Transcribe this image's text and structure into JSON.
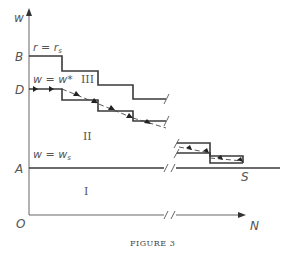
{
  "figure": {
    "caption": "FIGURE 3",
    "axes": {
      "y_label": "w",
      "x_label": "N",
      "origin_label": "O"
    },
    "y_ticks": [
      {
        "label": "B",
        "y": 56
      },
      {
        "label": "D",
        "y": 89
      },
      {
        "label": "A",
        "y": 168
      }
    ],
    "curve_labels": {
      "r_eq": "r = r",
      "r_sub": "s",
      "wstar_eq": "w = w*",
      "ws_eq": "w = w",
      "ws_sub": "s"
    },
    "regions": {
      "I": "I",
      "II": "II",
      "III": "III"
    },
    "point_label": "S"
  }
}
